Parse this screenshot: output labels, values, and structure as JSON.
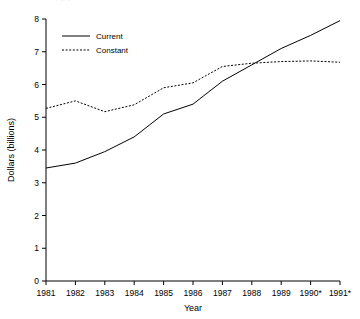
{
  "chart_data": {
    "type": "line",
    "title": "",
    "xlabel": "Year",
    "ylabel": "Dollars (billions)",
    "x": [
      "1981",
      "1982",
      "1983",
      "1984",
      "1985",
      "1986",
      "1987",
      "1988",
      "1989",
      "1990*",
      "1991*"
    ],
    "xtick_labels": [
      "1981",
      "1982",
      "1983",
      "1984",
      "1985",
      "1986",
      "1987",
      "1988",
      "1989",
      "1990*",
      "1991*"
    ],
    "ytick_labels": [
      "0",
      "1",
      "2",
      "3",
      "4",
      "5",
      "6",
      "7",
      "8"
    ],
    "ytick_values": [
      0,
      1,
      2,
      3,
      4,
      5,
      6,
      7,
      8
    ],
    "ylim": [
      0,
      8
    ],
    "grid": false,
    "legend_position": "upper-left-inside",
    "series": [
      {
        "name": "Current",
        "style": "solid",
        "color": "#000000",
        "values": [
          3.45,
          3.6,
          3.95,
          4.4,
          5.1,
          5.4,
          6.1,
          6.6,
          7.1,
          7.5,
          7.95
        ]
      },
      {
        "name": "Constant",
        "style": "dotted",
        "color": "#000000",
        "values": [
          5.27,
          5.5,
          5.17,
          5.38,
          5.9,
          6.05,
          6.55,
          6.65,
          6.7,
          6.72,
          6.68
        ]
      }
    ]
  },
  "legend": {
    "entries": [
      {
        "label": "Current",
        "style": "solid"
      },
      {
        "label": "Constant",
        "style": "dotted"
      }
    ]
  },
  "axes": {
    "y_title": "Dollars (billions)",
    "x_title": "Year"
  },
  "top_fragment": {
    "text": "·  ··  ·"
  }
}
